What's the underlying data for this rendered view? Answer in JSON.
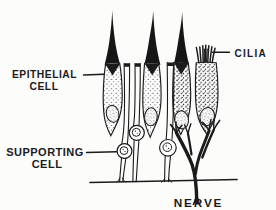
{
  "diagram": {
    "ink_color": "#1b1b1b",
    "background_color": "#fcfcfb",
    "labels": {
      "epithelial_line1": "EPITHELIAL",
      "epithelial_line2": "CELL",
      "supporting_line1": "SUPPORTING",
      "supporting_line2": "CELL",
      "cilia": "CILIA",
      "nerve": "NERVE"
    }
  }
}
